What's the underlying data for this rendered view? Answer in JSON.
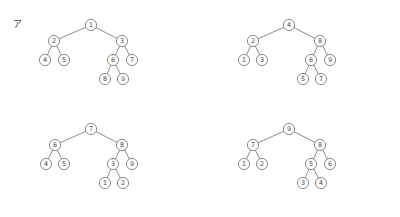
{
  "figure": {
    "kind": "binary-tree-diagram-set",
    "panel_count": 4,
    "node_radius": 5.6,
    "colors": {
      "stroke": "#6e6e6e",
      "node_fill": "#ffffff",
      "text": "#4a4a4a",
      "label_text": "#3b3b3b",
      "background": "#ffffff"
    }
  },
  "panels": [
    {
      "id": "a",
      "label": "ア",
      "nodes": [
        {
          "name": "root",
          "value": "1",
          "x": 91,
          "y": 25
        },
        {
          "name": "left",
          "value": "2",
          "x": 54,
          "y": 41
        },
        {
          "name": "right",
          "value": "3",
          "x": 122,
          "y": 41
        },
        {
          "name": "left-left",
          "value": "4",
          "x": 45,
          "y": 60
        },
        {
          "name": "left-right",
          "value": "5",
          "x": 64,
          "y": 60
        },
        {
          "name": "right-left",
          "value": "6",
          "x": 113,
          "y": 60
        },
        {
          "name": "right-right",
          "value": "7",
          "x": 132,
          "y": 60
        },
        {
          "name": "right-left-left",
          "value": "8",
          "x": 105,
          "y": 79
        },
        {
          "name": "right-left-right",
          "value": "9",
          "x": 123,
          "y": 79
        }
      ],
      "edges": [
        [
          "root",
          "left"
        ],
        [
          "root",
          "right"
        ],
        [
          "left",
          "left-left"
        ],
        [
          "left",
          "left-right"
        ],
        [
          "right",
          "right-left"
        ],
        [
          "right",
          "right-right"
        ],
        [
          "right-left",
          "right-left-left"
        ],
        [
          "right-left",
          "right-left-right"
        ]
      ]
    },
    {
      "id": "b",
      "label": "イ",
      "nodes": [
        {
          "name": "root",
          "value": "4",
          "x": 89,
          "y": 25
        },
        {
          "name": "left",
          "value": "2",
          "x": 53,
          "y": 41
        },
        {
          "name": "right",
          "value": "8",
          "x": 120,
          "y": 41
        },
        {
          "name": "left-left",
          "value": "1",
          "x": 44,
          "y": 60
        },
        {
          "name": "left-right",
          "value": "3",
          "x": 62,
          "y": 60
        },
        {
          "name": "right-left",
          "value": "6",
          "x": 111,
          "y": 60
        },
        {
          "name": "right-right",
          "value": "9",
          "x": 130,
          "y": 60
        },
        {
          "name": "right-left-left",
          "value": "5",
          "x": 103,
          "y": 79
        },
        {
          "name": "right-left-right",
          "value": "7",
          "x": 121,
          "y": 79
        }
      ],
      "edges": [
        [
          "root",
          "left"
        ],
        [
          "root",
          "right"
        ],
        [
          "left",
          "left-left"
        ],
        [
          "left",
          "left-right"
        ],
        [
          "right",
          "right-left"
        ],
        [
          "right",
          "right-right"
        ],
        [
          "right-left",
          "right-left-left"
        ],
        [
          "right-left",
          "right-left-right"
        ]
      ]
    },
    {
      "id": "c",
      "label": "ウ",
      "nodes": [
        {
          "name": "root",
          "value": "7",
          "x": 91,
          "y": 20
        },
        {
          "name": "left",
          "value": "6",
          "x": 55,
          "y": 36
        },
        {
          "name": "right",
          "value": "8",
          "x": 122,
          "y": 36
        },
        {
          "name": "left-left",
          "value": "4",
          "x": 46,
          "y": 55
        },
        {
          "name": "left-right",
          "value": "5",
          "x": 64,
          "y": 55
        },
        {
          "name": "right-left",
          "value": "3",
          "x": 113,
          "y": 55
        },
        {
          "name": "right-right",
          "value": "9",
          "x": 132,
          "y": 55
        },
        {
          "name": "right-left-left",
          "value": "1",
          "x": 105,
          "y": 74
        },
        {
          "name": "right-left-right",
          "value": "2",
          "x": 123,
          "y": 74
        }
      ],
      "edges": [
        [
          "root",
          "left"
        ],
        [
          "root",
          "right"
        ],
        [
          "left",
          "left-left"
        ],
        [
          "left",
          "left-right"
        ],
        [
          "right",
          "right-left"
        ],
        [
          "right",
          "right-right"
        ],
        [
          "right-left",
          "right-left-left"
        ],
        [
          "right-left",
          "right-left-right"
        ]
      ]
    },
    {
      "id": "d",
      "label": "エ",
      "nodes": [
        {
          "name": "root",
          "value": "9",
          "x": 89,
          "y": 20
        },
        {
          "name": "left",
          "value": "7",
          "x": 53,
          "y": 36
        },
        {
          "name": "right",
          "value": "8",
          "x": 120,
          "y": 36
        },
        {
          "name": "left-left",
          "value": "1",
          "x": 44,
          "y": 55
        },
        {
          "name": "left-right",
          "value": "2",
          "x": 62,
          "y": 55
        },
        {
          "name": "right-left",
          "value": "5",
          "x": 111,
          "y": 55
        },
        {
          "name": "right-right",
          "value": "6",
          "x": 130,
          "y": 55
        },
        {
          "name": "right-left-left",
          "value": "3",
          "x": 103,
          "y": 74
        },
        {
          "name": "right-left-right",
          "value": "4",
          "x": 121,
          "y": 74
        }
      ],
      "edges": [
        [
          "root",
          "left"
        ],
        [
          "root",
          "right"
        ],
        [
          "left",
          "left-left"
        ],
        [
          "left",
          "left-right"
        ],
        [
          "right",
          "right-left"
        ],
        [
          "right",
          "right-right"
        ],
        [
          "right-left",
          "right-left-left"
        ],
        [
          "right-left",
          "right-left-right"
        ]
      ]
    }
  ]
}
